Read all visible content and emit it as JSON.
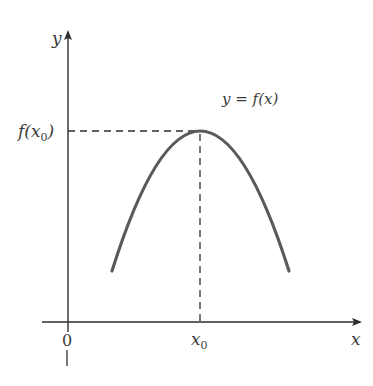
{
  "diagram": {
    "type": "function-maximum",
    "labels": {
      "y_axis": "y",
      "x_axis": "x",
      "origin": "0",
      "f_of_x0": "f(x",
      "f_of_x0_sub": "0",
      "f_of_x0_close": ")",
      "x0": "x",
      "x0_sub": "0",
      "curve": "y = f(x)"
    },
    "colors": {
      "axis": "#2e2e2e",
      "curve": "#5a5a5a",
      "dashed": "#2e2e2e",
      "text": "#3a3a3a"
    }
  }
}
